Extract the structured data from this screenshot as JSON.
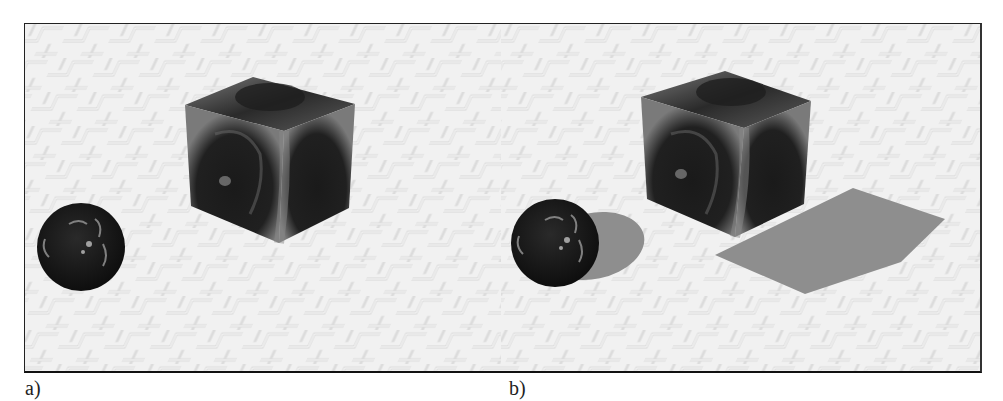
{
  "figure": {
    "panels": [
      {
        "id": "a",
        "label": "a)",
        "description": "Scene without shadows",
        "objects": [
          "textured sphere",
          "textured cube"
        ],
        "shadows": false
      },
      {
        "id": "b",
        "label": "b)",
        "description": "Scene with shadows",
        "objects": [
          "textured sphere",
          "textured cube",
          "sphere shadow",
          "cube shadow"
        ],
        "shadows": true
      }
    ],
    "colors": {
      "floor": "#e9e9e9",
      "floor_pattern": "#d2d2d2",
      "object_dark": "#1c1c1c",
      "object_mid": "#6a6a6a",
      "shadow": "#8e8e8e",
      "border": "#222222"
    }
  }
}
